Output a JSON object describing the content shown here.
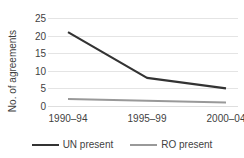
{
  "chart_data": {
    "type": "line",
    "title": "",
    "xlabel": "",
    "ylabel": "No. of agreements",
    "categories": [
      "1990–94",
      "1995–99",
      "2000–04"
    ],
    "series": [
      {
        "name": "UN present",
        "values": [
          21,
          8,
          5
        ],
        "color": "#333333"
      },
      {
        "name": "RO present",
        "values": [
          2,
          1.5,
          1
        ],
        "color": "#999999"
      }
    ],
    "ylim": [
      0,
      25
    ],
    "yticks": [
      0,
      5,
      10,
      15,
      20,
      25
    ],
    "ytick_labels": [
      "0",
      "5",
      "10",
      "15",
      "20",
      "25"
    ],
    "grid": true,
    "grid_color": "#e4e4e4",
    "legend_position": "bottom"
  },
  "legend": {
    "items": [
      {
        "label": "UN present",
        "color": "#333333",
        "width": 2.2
      },
      {
        "label": "RO present",
        "color": "#999999",
        "width": 2.0
      }
    ]
  }
}
